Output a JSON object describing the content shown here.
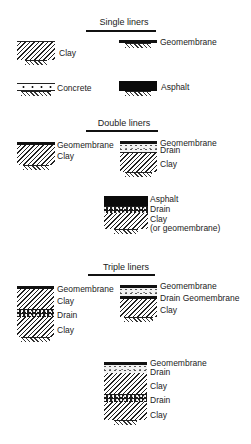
{
  "sections": [
    {
      "title": "Single liners",
      "liners": [
        {
          "id": "single-clay",
          "labels": [
            "Clay"
          ],
          "layers": [
            "clay"
          ]
        },
        {
          "id": "single-geomembrane",
          "labels": [
            "Geomembrane"
          ],
          "layers": [
            "geomembrane"
          ]
        },
        {
          "id": "single-concrete",
          "labels": [
            "Concrete"
          ],
          "layers": [
            "concrete"
          ]
        },
        {
          "id": "single-asphalt",
          "labels": [
            "Asphalt"
          ],
          "layers": [
            "asphalt"
          ]
        }
      ]
    },
    {
      "title": "Double liners",
      "liners": [
        {
          "id": "double-geo-clay",
          "labels": [
            "Geomembrane",
            "Clay"
          ],
          "layers": [
            "geomembrane",
            "clay"
          ]
        },
        {
          "id": "double-geo-drain-clay",
          "labels": [
            "Geomembrane",
            "Drain",
            "Clay"
          ],
          "layers": [
            "geomembrane",
            "drain",
            "clay"
          ]
        },
        {
          "id": "double-asphalt-drain-clay",
          "labels": [
            "Asphalt",
            "Drain",
            "Clay",
            "(or geomembrane)"
          ],
          "layers": [
            "asphalt",
            "drain",
            "clay"
          ]
        }
      ]
    },
    {
      "title": "Triple liners",
      "liners": [
        {
          "id": "triple-geo-clay-drain-clay",
          "labels": [
            "Geomembrane",
            "Clay",
            "Drain",
            "Clay"
          ],
          "layers": [
            "geomembrane",
            "clay",
            "drain",
            "clay"
          ]
        },
        {
          "id": "triple-geo-drain-geo-clay",
          "labels": [
            "Geomembrane",
            "Drain Geomembrane",
            "Clay"
          ],
          "layers": [
            "geomembrane",
            "drain",
            "geomembrane",
            "clay"
          ]
        },
        {
          "id": "triple-geo-drain-clay-drain-clay",
          "labels": [
            "Geomembrane",
            "Drain",
            "Clay",
            "Drain",
            "Clay"
          ],
          "layers": [
            "geomembrane",
            "drain",
            "clay",
            "drain",
            "clay"
          ]
        }
      ]
    }
  ]
}
